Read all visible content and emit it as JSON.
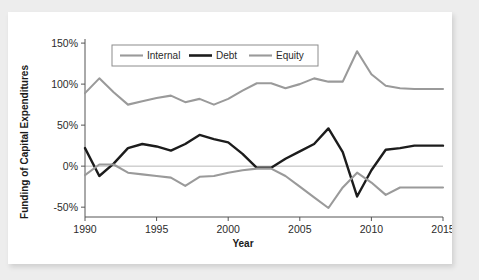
{
  "chart_data": {
    "type": "line",
    "title": "",
    "xlabel": "Year",
    "ylabel": "Funding of Capital Expenditures",
    "xlim": [
      1990,
      2015
    ],
    "ylim": [
      -62,
      155
    ],
    "grid": false,
    "zero_reference_line": true,
    "legend_position": "top-center-inside",
    "x": [
      1990,
      1991,
      1992,
      1993,
      1994,
      1995,
      1996,
      1997,
      1998,
      1999,
      2000,
      2001,
      2002,
      2003,
      2004,
      2005,
      2006,
      2007,
      2008,
      2009,
      2010,
      2011,
      2012,
      2013,
      2014,
      2015
    ],
    "xticks": [
      1990,
      1995,
      2000,
      2005,
      2010,
      2015
    ],
    "xtick_labels": [
      "1990",
      "1995",
      "2000",
      "2005",
      "2010",
      "2015"
    ],
    "yticks": [
      -50,
      0,
      50,
      100,
      150
    ],
    "ytick_labels": [
      "-50%",
      "0%",
      "50%",
      "100%",
      "150%"
    ],
    "series": [
      {
        "name": "Internal",
        "color": "#9a9a9a",
        "width": 2.1,
        "values": [
          89,
          107,
          90,
          75,
          79,
          83,
          86,
          78,
          82,
          75,
          82,
          92,
          101,
          101,
          95,
          100,
          107,
          103,
          103,
          140,
          112,
          98,
          95,
          94,
          94,
          94
        ]
      },
      {
        "name": "Debt",
        "color": "#1c1c1c",
        "width": 2.4,
        "values": [
          22,
          -12,
          3,
          22,
          27,
          24,
          19,
          27,
          38,
          33,
          29,
          15,
          -2,
          -2,
          9,
          18,
          27,
          46,
          17,
          -37,
          -5,
          20,
          22,
          25,
          25,
          25
        ]
      },
      {
        "name": "Equity",
        "color": "#9a9a9a",
        "width": 2.1,
        "values": [
          -11,
          2,
          2,
          -8,
          -10,
          -12,
          -14,
          -24,
          -13,
          -12,
          -8,
          -5,
          -3,
          -3,
          -12,
          -25,
          -38,
          -51,
          -26,
          -8,
          -20,
          -35,
          -26,
          -26,
          -26,
          -26
        ]
      }
    ],
    "legend": [
      {
        "label": "Internal",
        "color": "#9a9a9a"
      },
      {
        "label": "Debt",
        "color": "#1c1c1c"
      },
      {
        "label": "Equity",
        "color": "#9a9a9a"
      }
    ]
  }
}
